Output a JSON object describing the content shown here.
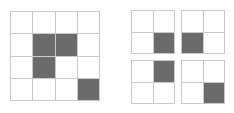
{
  "figure": {
    "background_color": "#ffffff",
    "grid_line_color": "#c9c9c9",
    "filled_cell_color": "#6b6b6b",
    "empty_cell_color": "#ffffff"
  },
  "grids": {
    "large": {
      "name": "4x4-grid",
      "rows": 4,
      "columns": 4,
      "cells": [
        [
          0,
          0,
          0,
          0
        ],
        [
          0,
          1,
          1,
          0
        ],
        [
          0,
          1,
          0,
          0
        ],
        [
          0,
          0,
          0,
          1
        ]
      ],
      "filled_count": 4
    },
    "small": [
      {
        "name": "2x2-grid-top-left",
        "rows": 2,
        "columns": 2,
        "cells": [
          [
            0,
            0
          ],
          [
            0,
            1
          ]
        ],
        "filled_count": 1
      },
      {
        "name": "2x2-grid-top-right",
        "rows": 2,
        "columns": 2,
        "cells": [
          [
            0,
            0
          ],
          [
            1,
            0
          ]
        ],
        "filled_count": 1
      },
      {
        "name": "2x2-grid-bottom-left",
        "rows": 2,
        "columns": 2,
        "cells": [
          [
            0,
            1
          ],
          [
            0,
            0
          ]
        ],
        "filled_count": 1
      },
      {
        "name": "2x2-grid-bottom-right",
        "rows": 2,
        "columns": 2,
        "cells": [
          [
            0,
            0
          ],
          [
            0,
            1
          ]
        ],
        "filled_count": 1
      }
    ]
  }
}
